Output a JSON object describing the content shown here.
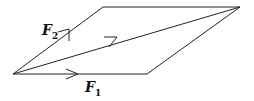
{
  "diagram": {
    "type": "parallelogram-of-forces",
    "vectors": [
      {
        "id": "F1",
        "label": "F",
        "subscript": "1"
      },
      {
        "id": "F2",
        "label": "F",
        "subscript": "2"
      },
      {
        "id": "resultant",
        "label": ""
      }
    ],
    "stroke_color": "#222222"
  }
}
